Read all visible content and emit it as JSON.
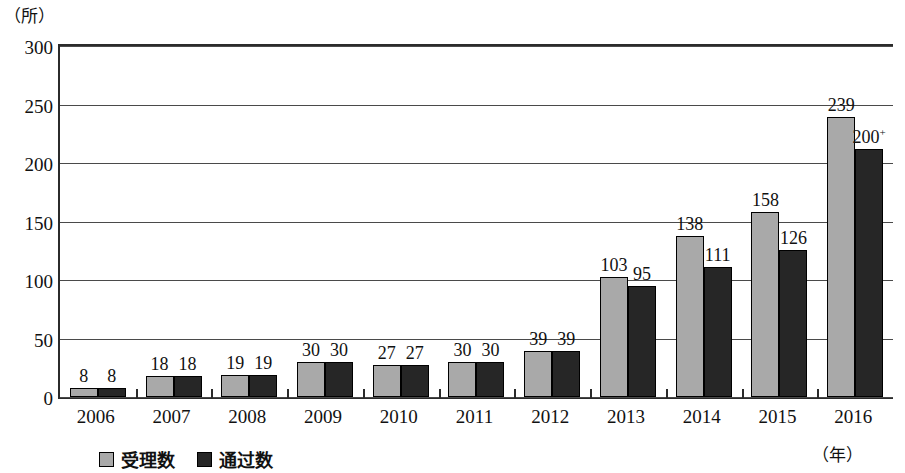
{
  "chart_data": {
    "type": "bar",
    "title": "",
    "xlabel": "（年）",
    "ylabel": "（所）",
    "ylim": [
      0,
      300
    ],
    "ytick_values": [
      0,
      50,
      100,
      150,
      200,
      250,
      300
    ],
    "ytick_labels": [
      "0",
      "50",
      "100",
      "150",
      "200",
      "250",
      "300"
    ],
    "grid": true,
    "legend_position": "bottom-left",
    "categories": [
      "2006",
      "2007",
      "2008",
      "2009",
      "2010",
      "2011",
      "2012",
      "2013",
      "2014",
      "2015",
      "2016"
    ],
    "series": [
      {
        "name": "受理数",
        "color": "#a9a9a9",
        "values": [
          8,
          18,
          19,
          30,
          27,
          30,
          39,
          103,
          138,
          158,
          239
        ],
        "labels": [
          "8",
          "18",
          "19",
          "30",
          "27",
          "30",
          "39",
          "103",
          "138",
          "158",
          "239"
        ]
      },
      {
        "name": "通过数",
        "color": "#262626",
        "values": [
          8,
          18,
          19,
          30,
          27,
          30,
          39,
          95,
          111,
          126,
          212
        ],
        "labels": [
          "8",
          "18",
          "19",
          "30",
          "27",
          "30",
          "39",
          "95",
          "111",
          "126",
          "200+"
        ],
        "label_html": [
          "8",
          "18",
          "19",
          "30",
          "27",
          "30",
          "39",
          "95",
          "111",
          "126",
          "200<sup>+</sup>"
        ]
      }
    ]
  },
  "axes": {
    "unit_y": "（所）",
    "unit_x": "（年）"
  },
  "legend": {
    "items": [
      {
        "label": "受理数",
        "color": "#a9a9a9"
      },
      {
        "label": "通过数",
        "color": "#262626"
      }
    ]
  },
  "colors": {
    "series_accepted": "#a9a9a9",
    "series_passed": "#262626",
    "axis": "#2b2b2b",
    "grid": "#4a4a4a",
    "background": "#ffffff"
  }
}
